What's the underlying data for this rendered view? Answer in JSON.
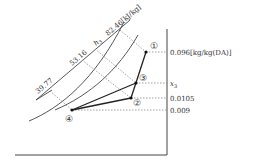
{
  "diagram": {
    "type": "psychrometric-chart-sketch",
    "enthalpy_labels": {
      "h1": "39.77",
      "h2": "53.16",
      "h3_symbol": "h",
      "h3_sub": "3",
      "h4": "82.46[kJ/kg]"
    },
    "humidity_labels": {
      "x1": "0.096[kg/kg(DA)]",
      "x3_symbol": "x",
      "x3_sub": "3",
      "x2": "0.0105",
      "x4": "0.009"
    },
    "points": [
      {
        "id": "1",
        "label": "①",
        "x": 146,
        "y": 52
      },
      {
        "id": "2",
        "label": "②",
        "x": 131,
        "y": 98
      },
      {
        "id": "3",
        "label": "③",
        "x": 136,
        "y": 83
      },
      {
        "id": "4",
        "label": "④",
        "x": 72,
        "y": 110
      }
    ],
    "process_lines": [
      {
        "from": "1",
        "to": "2"
      },
      {
        "from": "2",
        "to": "4"
      },
      {
        "from": "4",
        "to": "3"
      }
    ],
    "colors": {
      "line": "#222222",
      "axis": "#444444",
      "dotted": "#888888"
    }
  }
}
